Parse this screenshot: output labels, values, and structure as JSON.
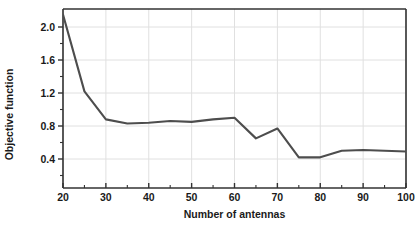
{
  "chart_data": {
    "type": "line",
    "title": "",
    "xlabel": "Number of antennas",
    "ylabel": "Objective function",
    "x": [
      20,
      25,
      30,
      35,
      40,
      45,
      50,
      55,
      60,
      65,
      70,
      75,
      80,
      85,
      90,
      95,
      100
    ],
    "values": [
      2.15,
      1.22,
      0.88,
      0.83,
      0.84,
      0.86,
      0.85,
      0.88,
      0.9,
      0.65,
      0.77,
      0.42,
      0.42,
      0.5,
      0.51,
      0.5,
      0.49
    ],
    "series": [
      {
        "name": "Objective function",
        "values": [
          2.15,
          1.22,
          0.88,
          0.83,
          0.84,
          0.86,
          0.85,
          0.88,
          0.9,
          0.65,
          0.77,
          0.42,
          0.42,
          0.5,
          0.51,
          0.5,
          0.49
        ]
      }
    ],
    "xlim": [
      20,
      100
    ],
    "ylim": [
      0.2,
      2.15
    ],
    "xticks": [
      20,
      30,
      40,
      50,
      60,
      70,
      80,
      90,
      100
    ],
    "xtick_labels": [
      "20",
      "30",
      "40",
      "50",
      "60",
      "70",
      "80",
      "90",
      "100"
    ],
    "yticks": [
      0.4,
      0.8,
      1.2,
      1.6,
      2.0
    ],
    "ytick_labels": [
      "0.4",
      "0.8",
      "1.2",
      "1.6",
      "2.0"
    ],
    "grid": true,
    "legend": "none",
    "line_color": "#4d4d4d",
    "grid_color": "#e0e0e0",
    "axis_color": "#333333",
    "background_color": "#ffffff"
  }
}
